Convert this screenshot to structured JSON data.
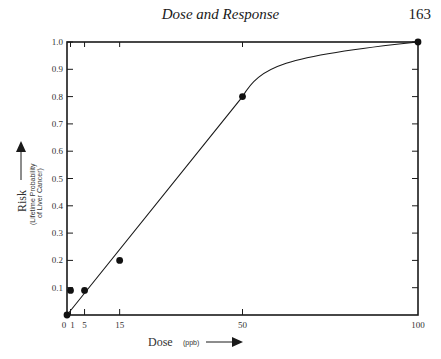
{
  "page": {
    "running_head": "Dose and Response",
    "page_number": "163"
  },
  "chart_data": {
    "type": "line",
    "title": "",
    "xlabel": "Dose",
    "xlabel_unit": "(ppb)",
    "ylabel": "Risk",
    "ylabel_sub_1": "(Lifetime Probability",
    "ylabel_sub_2": "of Liver Cancer)",
    "xlim": [
      0,
      100
    ],
    "ylim": [
      0,
      1.0
    ],
    "x_ticks": [
      0,
      1,
      5,
      15,
      50,
      100
    ],
    "x_tick_labels": [
      "0",
      "1",
      "5",
      "15",
      "50",
      "100"
    ],
    "y_ticks": [
      0.1,
      0.2,
      0.3,
      0.4,
      0.5,
      0.6,
      0.7,
      0.8,
      0.9,
      1.0
    ],
    "y_tick_labels": [
      "0.1",
      "0.2",
      "0.3",
      "0.4",
      "0.5",
      "0.6",
      "0.7",
      "0.8",
      "0.9",
      "1.0"
    ],
    "grid": false,
    "series": [
      {
        "name": "Observed data points",
        "style": "scatter",
        "x": [
          0,
          1,
          5,
          15,
          50,
          100
        ],
        "y": [
          0,
          0.09,
          0.09,
          0.2,
          0.8,
          1.0
        ]
      },
      {
        "name": "Dose-response curve",
        "style": "line",
        "x": [
          0,
          50,
          55,
          60,
          70,
          80,
          90,
          100
        ],
        "y": [
          0,
          0.8,
          0.85,
          0.88,
          0.92,
          0.95,
          0.975,
          1.0
        ]
      }
    ]
  }
}
